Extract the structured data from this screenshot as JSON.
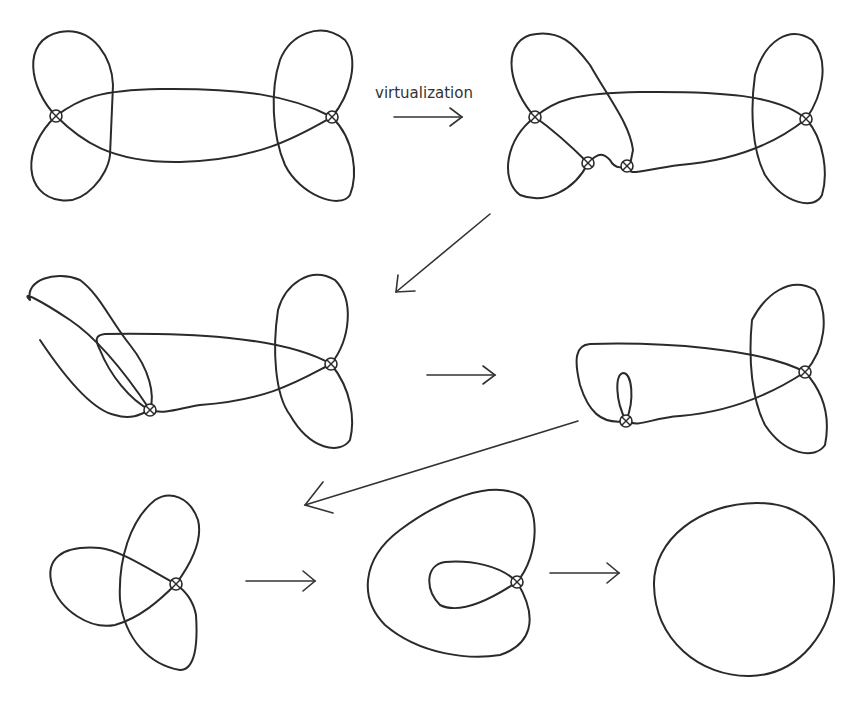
{
  "diagram": {
    "type": "process-sequence",
    "labels": {
      "step1_arrow": "virtualization"
    },
    "steps": [
      {
        "id": 1,
        "name": "two-lobed-virtual-curve",
        "virtual_crossings": 2
      },
      {
        "id": 2,
        "name": "virtualized-curve",
        "virtual_crossings": 4
      },
      {
        "id": 3,
        "name": "reduced-curve",
        "virtual_crossings": 2
      },
      {
        "id": 4,
        "name": "curve-with-small-loop",
        "virtual_crossings": 2
      },
      {
        "id": 5,
        "name": "trefoil-like-curve",
        "virtual_crossings": 1
      },
      {
        "id": 6,
        "name": "curl-curve",
        "virtual_crossings": 1
      },
      {
        "id": 7,
        "name": "circle",
        "virtual_crossings": 0
      }
    ],
    "colors": {
      "stroke": "#2a2a2a",
      "background": "#ffffff"
    }
  }
}
